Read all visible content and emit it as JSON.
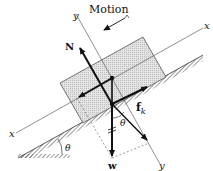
{
  "diagram": {
    "labels": {
      "motion": "Motion",
      "y_axis_top": "y",
      "y_axis_bottom": "y",
      "x_axis_right": "x",
      "x_axis_left": "x",
      "normal_force": "N",
      "friction_force": "f",
      "friction_subscript": "k",
      "weight": "w",
      "theta_incline": "θ",
      "theta_weight": "θ"
    },
    "elements": [
      "inclined-plane",
      "block",
      "x-axis",
      "y-axis",
      "normal-force-vector",
      "friction-force-vector",
      "weight-vector",
      "weight-component-vectors",
      "angle-markers",
      "motion-arrow"
    ],
    "colors": {
      "ink": "#111111",
      "block_fill": "#d9d9d9",
      "hatch": "#555555",
      "axis": "#444444"
    }
  }
}
